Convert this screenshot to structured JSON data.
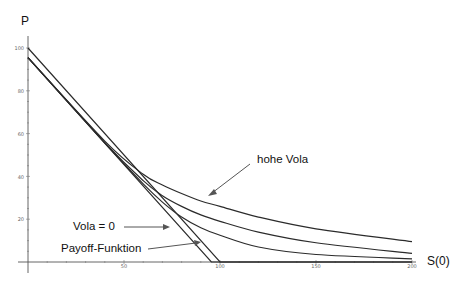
{
  "chart_data": {
    "type": "line",
    "title": "",
    "xlabel": "S(0)",
    "ylabel": "P",
    "xlim": [
      0,
      205
    ],
    "ylim": [
      0,
      102
    ],
    "x_ticks": [
      50,
      100,
      150,
      200
    ],
    "y_ticks": [
      20,
      40,
      60,
      80,
      100
    ],
    "grid": false,
    "legend": null,
    "strike": 100,
    "series": [
      {
        "name": "Payoff-Funktion",
        "kind": "straight",
        "x": [
          0,
          100,
          200
        ],
        "y": [
          100,
          0,
          0
        ]
      },
      {
        "name": "Vola = 0",
        "kind": "straight",
        "x": [
          0,
          95.5,
          200
        ],
        "y": [
          95.5,
          0,
          0
        ]
      },
      {
        "name": "low vola",
        "kind": "curve",
        "x": [
          0,
          40,
          60,
          70,
          80,
          90,
          100,
          120,
          150,
          200
        ],
        "y": [
          95.5,
          55.6,
          36.5,
          28,
          21,
          16,
          12.5,
          7,
          3.5,
          1.5
        ]
      },
      {
        "name": "mid vola",
        "kind": "curve",
        "x": [
          0,
          40,
          60,
          70,
          80,
          90,
          100,
          120,
          150,
          200
        ],
        "y": [
          95.5,
          55.8,
          38,
          31,
          26,
          22,
          19,
          14,
          9,
          4
        ]
      },
      {
        "name": "hohe Vola",
        "kind": "curve",
        "x": [
          0,
          40,
          60,
          70,
          80,
          90,
          100,
          120,
          150,
          200
        ],
        "y": [
          95.5,
          56.5,
          41,
          36,
          32,
          28.5,
          26,
          21,
          15.5,
          9.5
        ]
      }
    ],
    "annotations": [
      {
        "text": "hohe Vola",
        "points_to": "hohe Vola"
      },
      {
        "text": "Vola = 0",
        "points_to": "Vola = 0"
      },
      {
        "text": "Payoff-Funktion",
        "points_to": "Payoff-Funktion"
      }
    ]
  },
  "labels": {
    "y_axis": "P",
    "x_axis": "S(0)",
    "annot_high": "hohe Vola",
    "annot_zero": "Vola = 0",
    "annot_payoff": "Payoff-Funktion",
    "tick_x_50": "50",
    "tick_x_100": "100",
    "tick_x_150": "150",
    "tick_x_200": "200",
    "tick_y_20": "20",
    "tick_y_40": "40",
    "tick_y_60": "60",
    "tick_y_80": "80",
    "tick_y_100": "100"
  }
}
